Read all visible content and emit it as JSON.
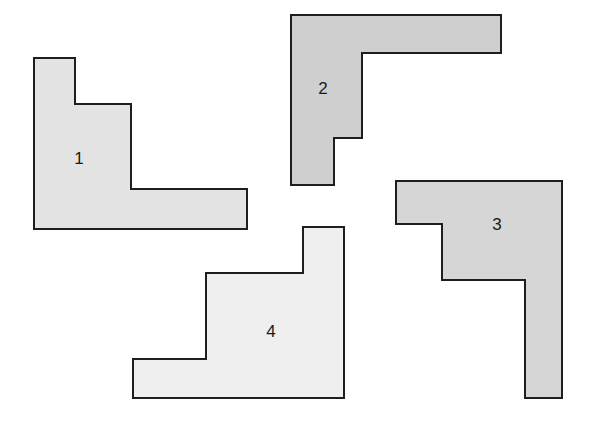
{
  "diagram": {
    "stroke_color": "#1e1e1e",
    "stroke_width": 2,
    "shapes": [
      {
        "label": "1",
        "fill": "#e3e3e3",
        "points": [
          [
            34,
            58
          ],
          [
            75,
            58
          ],
          [
            75,
            104
          ],
          [
            131,
            104
          ],
          [
            131,
            189
          ],
          [
            247,
            189
          ],
          [
            247,
            229
          ],
          [
            34,
            229
          ]
        ],
        "label_pos": [
          79,
          158
        ]
      },
      {
        "label": "2",
        "fill": "#cfcfcf",
        "points": [
          [
            291,
            15
          ],
          [
            501,
            15
          ],
          [
            501,
            53
          ],
          [
            362,
            53
          ],
          [
            362,
            138
          ],
          [
            334,
            138
          ],
          [
            334,
            185
          ],
          [
            291,
            185
          ]
        ],
        "label_pos": [
          323,
          88
        ]
      },
      {
        "label": "3",
        "fill": "#d6d6d6",
        "points": [
          [
            396,
            181
          ],
          [
            562,
            181
          ],
          [
            562,
            398
          ],
          [
            525,
            398
          ],
          [
            525,
            280
          ],
          [
            442,
            280
          ],
          [
            442,
            224
          ],
          [
            396,
            224
          ]
        ],
        "label_pos": [
          497,
          224
        ]
      },
      {
        "label": "4",
        "fill": "#efefef",
        "points": [
          [
            303,
            227
          ],
          [
            344,
            227
          ],
          [
            344,
            398
          ],
          [
            133,
            398
          ],
          [
            133,
            359
          ],
          [
            206,
            359
          ],
          [
            206,
            273
          ],
          [
            303,
            273
          ]
        ],
        "label_pos": [
          271,
          331
        ]
      }
    ]
  }
}
